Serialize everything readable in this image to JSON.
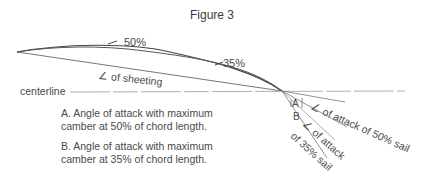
{
  "figure": {
    "title": "Figure 3"
  },
  "labels": {
    "camber_50": "50%",
    "camber_35": "35%",
    "sheeting_angle": "∠ of sheeting",
    "centerline": "centerline",
    "angle_a": "A",
    "angle_b": "B",
    "attack_50": "∠ of attack of 50% sail",
    "attack_35_line1": "∠ of attack",
    "attack_35_line2": "of 35% sail"
  },
  "legend": {
    "a": {
      "line1": "A.  Angle of attack with maximum",
      "line2": "camber at 50% of chord length."
    },
    "b": {
      "line1": "B.  Angle of attack with maximum",
      "line2": "camber at 35% of chord length."
    }
  },
  "colors": {
    "line": "#555555",
    "text": "#4a4a4a",
    "background": "#ffffff"
  }
}
